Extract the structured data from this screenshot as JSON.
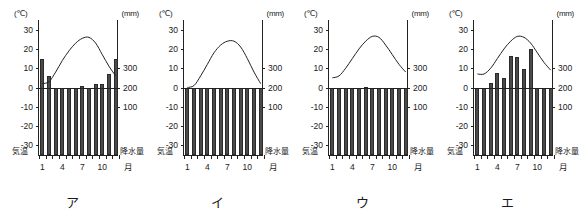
{
  "figure": {
    "left_unit": "(℃)",
    "right_unit": "(mm)",
    "temp_caption": "気温",
    "precip_caption": "降水量",
    "month_axis_label": "月",
    "month_ticks": [
      "1",
      "4",
      "7",
      "10"
    ],
    "temp_ticks": [
      "30",
      "20",
      "10",
      "0",
      "-10",
      "-20",
      "-30"
    ],
    "precip_ticks": [
      "300",
      "200",
      "100"
    ],
    "bar_color": "#4a4a4a",
    "axis_color": "#222222"
  },
  "chart_data": [
    {
      "type": "bar",
      "title": "ア",
      "xlabel": "月",
      "ylabel": "気温",
      "categories": [
        "1",
        "2",
        "3",
        "4",
        "5",
        "6",
        "7",
        "8",
        "9",
        "10",
        "11",
        "12"
      ],
      "ylim": [
        -35,
        35
      ],
      "y2lim": [
        0,
        350
      ],
      "grid": false,
      "series": [
        {
          "name": "降水量",
          "unit": "mm",
          "type": "bar",
          "values": [
            348,
            260,
            183,
            88,
            92,
            123,
            206,
            150,
            216,
            220,
            268,
            350
          ]
        },
        {
          "name": "気温",
          "unit": "℃",
          "type": "line",
          "values": [
            2,
            3,
            8,
            14,
            19,
            23,
            25.5,
            26,
            23,
            17,
            11,
            6
          ]
        }
      ]
    },
    {
      "type": "bar",
      "title": "イ",
      "xlabel": "月",
      "ylabel": "気温",
      "categories": [
        "1",
        "2",
        "3",
        "4",
        "5",
        "6",
        "7",
        "8",
        "9",
        "10",
        "11",
        "12"
      ],
      "ylim": [
        -35,
        35
      ],
      "y2lim": [
        0,
        350
      ],
      "grid": false,
      "series": [
        {
          "name": "降水量",
          "unit": "mm",
          "type": "bar",
          "values": [
            33,
            41,
            76,
            85,
            88,
            125,
            131,
            80,
            153,
            79,
            49,
            26
          ]
        },
        {
          "name": "気温",
          "unit": "℃",
          "type": "line",
          "values": [
            0,
            1,
            6,
            12,
            18,
            22,
            24,
            24,
            21,
            15,
            8,
            2
          ]
        }
      ]
    },
    {
      "type": "bar",
      "title": "ウ",
      "xlabel": "月",
      "ylabel": "気温",
      "categories": [
        "1",
        "2",
        "3",
        "4",
        "5",
        "6",
        "7",
        "8",
        "9",
        "10",
        "11",
        "12"
      ],
      "ylim": [
        -35,
        35
      ],
      "y2lim": [
        0,
        350
      ],
      "grid": false,
      "series": [
        {
          "name": "降水量",
          "unit": "mm",
          "type": "bar",
          "values": [
            46,
            52,
            66,
            69,
            90,
            201,
            146,
            111,
            168,
            126,
            56,
            52
          ]
        },
        {
          "name": "気温",
          "unit": "℃",
          "type": "line",
          "values": [
            5,
            6,
            10,
            15,
            20,
            24,
            26.5,
            26,
            22,
            17,
            12,
            8
          ]
        }
      ]
    },
    {
      "type": "bar",
      "title": "エ",
      "xlabel": "月",
      "ylabel": "気温",
      "categories": [
        "1",
        "2",
        "3",
        "4",
        "5",
        "6",
        "7",
        "8",
        "9",
        "10",
        "11",
        "12"
      ],
      "ylim": [
        -35,
        35
      ],
      "y2lim": [
        0,
        350
      ],
      "grid": false,
      "series": [
        {
          "name": "降水量",
          "unit": "mm",
          "type": "bar",
          "values": [
            50,
            80,
            225,
            275,
            250,
            365,
            360,
            295,
            400,
            148,
            115,
            38
          ]
        },
        {
          "name": "気温",
          "unit": "℃",
          "type": "line",
          "values": [
            7,
            7,
            10,
            15,
            20,
            24,
            26.5,
            26,
            23,
            18,
            13,
            9
          ]
        }
      ]
    }
  ]
}
